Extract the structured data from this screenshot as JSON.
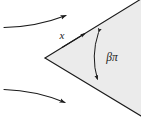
{
  "figure": {
    "name": "flow-past-wedge-diagram",
    "background_color": "#ffffff",
    "stroke_color": "#1a1a1a",
    "wedge": {
      "name": "wedge-body",
      "fill_color": "#ebebeb",
      "edge_color": "#1a1a1a",
      "apex": {
        "x": 45,
        "y": 58
      },
      "upper_tip": {
        "x": 140,
        "y": 2
      },
      "lower_tip": {
        "x": 140,
        "y": 114
      }
    },
    "labels": {
      "coordinate": "x",
      "angle": "βπ",
      "angle_beta": "β",
      "angle_pi": "π"
    },
    "angle_arc": {
      "name": "wedge-angle-arc",
      "start": {
        "x": 97,
        "y": 31
      },
      "end": {
        "x": 96,
        "y": 80
      },
      "arrowheads": "both"
    },
    "coordinate_arrow": {
      "name": "x-axis-arrow",
      "start": {
        "x": 60,
        "y": 48
      },
      "end": {
        "x": 86,
        "y": 33
      },
      "direction": "up-right"
    },
    "streamlines": [
      {
        "name": "upper-streamline",
        "start": {
          "x": 4,
          "y": 27
        },
        "end": {
          "x": 69,
          "y": 14
        },
        "curvature": "concave-up",
        "arrow": "end"
      },
      {
        "name": "lower-streamline",
        "start": {
          "x": 4,
          "y": 90
        },
        "end": {
          "x": 68,
          "y": 104
        },
        "curvature": "concave-down",
        "arrow": "end"
      }
    ]
  }
}
